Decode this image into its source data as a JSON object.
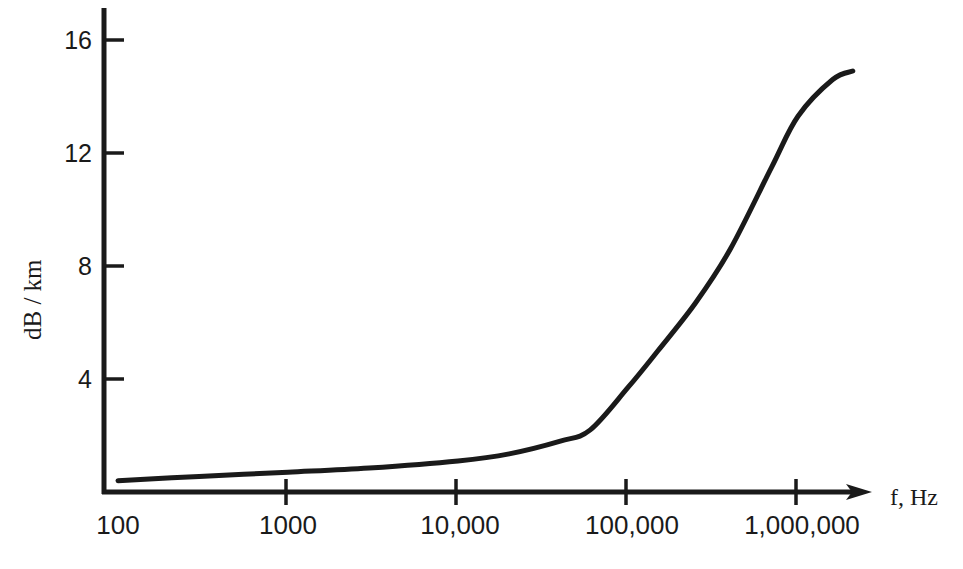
{
  "chart_data": {
    "type": "line",
    "title": "",
    "subtitle": "",
    "xlabel": "f, Hz",
    "ylabel": "dB / km",
    "xscale": "log",
    "yscale": "linear",
    "xlim": [
      100,
      3000000
    ],
    "ylim": [
      0,
      17
    ],
    "grid": false,
    "legend": null,
    "xticks": [
      {
        "value": 100,
        "label": "100"
      },
      {
        "value": 1000,
        "label": "1000"
      },
      {
        "value": 10000,
        "label": "10,000"
      },
      {
        "value": 100000,
        "label": "100,000"
      },
      {
        "value": 1000000,
        "label": "1,000,000"
      }
    ],
    "yticks": [
      {
        "value": 4,
        "label": "4"
      },
      {
        "value": 8,
        "label": "8"
      },
      {
        "value": 12,
        "label": "12"
      },
      {
        "value": 16,
        "label": "16"
      }
    ],
    "series": [
      {
        "name": "attenuation",
        "color": "#1a1a1a",
        "x": [
          100,
          300,
          1000,
          3000,
          10000,
          20000,
          40000,
          60000,
          100000,
          150000,
          250000,
          400000,
          700000,
          1000000,
          1600000,
          2100000
        ],
        "y": [
          0.4,
          0.55,
          0.7,
          0.85,
          1.1,
          1.35,
          1.8,
          2.2,
          3.7,
          5.0,
          6.7,
          8.6,
          11.5,
          13.3,
          14.6,
          14.9
        ]
      }
    ],
    "annotations": [],
    "axis_arrow": {
      "axis": "x",
      "direction": "right",
      "present": true
    }
  },
  "axes": {
    "x_axis_name": "frequency-axis",
    "y_axis_name": "attenuation-axis"
  }
}
